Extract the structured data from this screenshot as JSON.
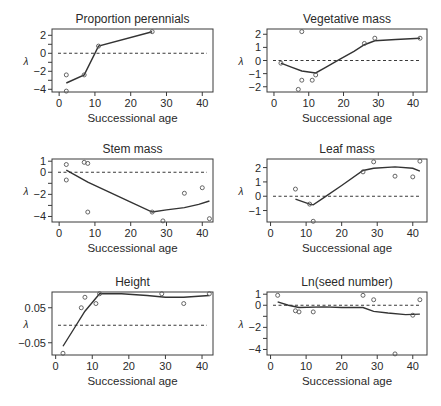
{
  "figure": {
    "xlabel": "Successional age",
    "ylabel": "λ"
  },
  "chart_data": [
    {
      "type": "scatter",
      "title": "Proportion perennials",
      "xlabel": "Successional age",
      "ylabel": "λ",
      "xlim": [
        -2,
        43
      ],
      "ylim": [
        -4.3,
        2.7
      ],
      "xticks": [
        0,
        10,
        20,
        30,
        40
      ],
      "yticks": [
        2,
        0,
        -2,
        -4
      ],
      "yticks_minor": [
        1,
        -1,
        -3
      ],
      "reference_line": 0,
      "points": [
        [
          2,
          -2.4
        ],
        [
          2,
          -4.2
        ],
        [
          7,
          -2.4
        ],
        [
          11,
          0.8
        ],
        [
          26,
          2.4
        ]
      ],
      "fit": [
        [
          2,
          -3.3
        ],
        [
          7,
          -2.4
        ],
        [
          11,
          0.8
        ],
        [
          26,
          2.4
        ]
      ],
      "frame": {
        "left": 52,
        "top": 29,
        "right": 213,
        "bottom": 92
      }
    },
    {
      "type": "scatter",
      "title": "Vegetative mass",
      "xlabel": "Successional age",
      "ylabel": "λ",
      "xlim": [
        -2,
        44
      ],
      "ylim": [
        -2.4,
        2.4
      ],
      "xticks": [
        0,
        10,
        20,
        30,
        40
      ],
      "yticks": [
        2,
        1,
        0,
        -1,
        -2
      ],
      "yticks_minor": [],
      "reference_line": 0,
      "points": [
        [
          2,
          -0.2
        ],
        [
          7,
          -2.2
        ],
        [
          8,
          -1.5
        ],
        [
          8,
          2.2
        ],
        [
          11,
          -1.5
        ],
        [
          12,
          -1.1
        ],
        [
          26,
          1.3
        ],
        [
          29,
          1.7
        ],
        [
          42,
          1.7
        ]
      ],
      "fit": [
        [
          2,
          -0.2
        ],
        [
          5,
          -0.5
        ],
        [
          8,
          -0.8
        ],
        [
          12,
          -0.95
        ],
        [
          15,
          -0.5
        ],
        [
          19,
          0.1
        ],
        [
          23,
          0.7
        ],
        [
          26,
          1.2
        ],
        [
          29,
          1.5
        ],
        [
          35,
          1.6
        ],
        [
          42,
          1.7
        ]
      ],
      "frame": {
        "left": 267,
        "top": 29,
        "right": 427,
        "bottom": 92
      }
    },
    {
      "type": "scatter",
      "title": "Stem mass",
      "xlabel": "Successional age",
      "ylabel": "λ",
      "xlim": [
        -2,
        43
      ],
      "ylim": [
        -4.5,
        1.2
      ],
      "xticks": [
        0,
        10,
        20,
        30,
        40
      ],
      "yticks": [
        1,
        0,
        -2,
        -4
      ],
      "yticks_minor": [
        -1,
        -3
      ],
      "reference_line": 0,
      "points": [
        [
          2,
          0.7
        ],
        [
          2,
          -0.7
        ],
        [
          7,
          0.9
        ],
        [
          8,
          0.8
        ],
        [
          8,
          -3.6
        ],
        [
          26,
          -3.6
        ],
        [
          29,
          -4.4
        ],
        [
          35,
          -1.9
        ],
        [
          40,
          -1.4
        ],
        [
          42,
          -4.2
        ]
      ],
      "fit": [
        [
          2,
          0.2
        ],
        [
          8,
          -0.9
        ],
        [
          14,
          -1.8
        ],
        [
          20,
          -2.7
        ],
        [
          26,
          -3.6
        ],
        [
          30,
          -3.4
        ],
        [
          35,
          -3.2
        ],
        [
          39,
          -2.9
        ],
        [
          42,
          -2.6
        ]
      ],
      "frame": {
        "left": 52,
        "top": 159,
        "right": 213,
        "bottom": 222
      }
    },
    {
      "type": "scatter",
      "title": "Leaf mass",
      "xlabel": "Successional age",
      "ylabel": "λ",
      "xlim": [
        -1,
        44
      ],
      "ylim": [
        -1.8,
        2.6
      ],
      "xticks": [
        0,
        10,
        20,
        30,
        40
      ],
      "yticks": [
        2,
        1,
        0,
        -1
      ],
      "yticks_minor": [],
      "reference_line": 0,
      "points": [
        [
          7,
          0.5
        ],
        [
          11,
          -0.55
        ],
        [
          12,
          -1.75
        ],
        [
          26,
          1.7
        ],
        [
          29,
          2.4
        ],
        [
          35,
          1.4
        ],
        [
          40,
          1.35
        ],
        [
          42,
          2.45
        ]
      ],
      "fit": [
        [
          7,
          -0.2
        ],
        [
          11,
          -0.55
        ],
        [
          12,
          -0.6
        ],
        [
          15,
          -0.1
        ],
        [
          20,
          0.75
        ],
        [
          26,
          1.8
        ],
        [
          29,
          1.95
        ],
        [
          35,
          2.05
        ],
        [
          40,
          1.95
        ],
        [
          42,
          1.75
        ]
      ],
      "frame": {
        "left": 267,
        "top": 159,
        "right": 427,
        "bottom": 222
      }
    },
    {
      "type": "scatter",
      "title": "Height",
      "xlabel": "Successional age",
      "ylabel": "λ",
      "xlim": [
        -1,
        43
      ],
      "ylim": [
        -0.085,
        0.095
      ],
      "xticks": [
        0,
        10,
        20,
        30,
        40
      ],
      "yticks": [
        0.05,
        -0.05
      ],
      "ytick_labels": [
        "0.05",
        "−0.05"
      ],
      "yticks_minor": [],
      "reference_line": 0,
      "points": [
        [
          2,
          -0.08
        ],
        [
          7,
          0.05
        ],
        [
          8,
          0.08
        ],
        [
          11,
          0.062
        ],
        [
          12,
          0.09
        ],
        [
          29,
          0.09
        ],
        [
          35,
          0.062
        ],
        [
          42,
          0.09
        ]
      ],
      "fit": [
        [
          2,
          -0.06
        ],
        [
          5,
          -0.01
        ],
        [
          8,
          0.04
        ],
        [
          12,
          0.09
        ],
        [
          18,
          0.09
        ],
        [
          25,
          0.085
        ],
        [
          30,
          0.08
        ],
        [
          35,
          0.08
        ],
        [
          42,
          0.085
        ]
      ],
      "frame": {
        "left": 52,
        "top": 292,
        "right": 213,
        "bottom": 355
      }
    },
    {
      "type": "scatter",
      "title": "Ln(seed number)",
      "xlabel": "Successional age",
      "ylabel": "λ",
      "xlim": [
        -1,
        44
      ],
      "ylim": [
        -4.5,
        1.2
      ],
      "xticks": [
        0,
        10,
        20,
        30,
        40
      ],
      "yticks": [
        1,
        0,
        -2,
        -4
      ],
      "ytick_labels": [
        "1",
        "0",
        "−2",
        "−4"
      ],
      "yticks_minor": [
        -1,
        -3
      ],
      "reference_line": 0,
      "points": [
        [
          2,
          0.9
        ],
        [
          7,
          -0.5
        ],
        [
          8,
          -0.6
        ],
        [
          12,
          -0.6
        ],
        [
          26,
          0.9
        ],
        [
          29,
          0.5
        ],
        [
          35,
          -4.4
        ],
        [
          40,
          -0.9
        ],
        [
          42,
          0.5
        ]
      ],
      "fit": [
        [
          2,
          0.3
        ],
        [
          5,
          0.0
        ],
        [
          8,
          -0.2
        ],
        [
          15,
          -0.15
        ],
        [
          20,
          -0.2
        ],
        [
          26,
          -0.2
        ],
        [
          29,
          -0.55
        ],
        [
          33,
          -0.7
        ],
        [
          38,
          -0.85
        ],
        [
          42,
          -0.8
        ]
      ],
      "frame": {
        "left": 267,
        "top": 292,
        "right": 427,
        "bottom": 355
      }
    }
  ]
}
